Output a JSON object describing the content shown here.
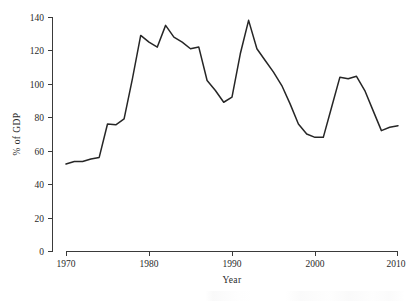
{
  "chart_data": {
    "type": "line",
    "title": "",
    "subtitle": "",
    "xlabel": "Year",
    "ylabel": "% of GDP",
    "xlim": [
      1970,
      2010
    ],
    "ylim": [
      0,
      140
    ],
    "xticks": [
      1970,
      1980,
      1990,
      2000,
      2010
    ],
    "yticks": [
      0,
      20,
      40,
      60,
      80,
      100,
      120,
      140
    ],
    "xtick_labels": [
      "1970",
      "1980",
      "1990",
      "2000",
      "2010"
    ],
    "ytick_labels": [
      "0",
      "20",
      "40",
      "60",
      "80",
      "100",
      "120",
      "140"
    ],
    "grid": false,
    "legend": null,
    "legend_position": "none",
    "line_color": "#262626",
    "series": [
      {
        "name": "% of GDP",
        "x": [
          1970,
          1971,
          1972,
          1973,
          1974,
          1975,
          1976,
          1977,
          1978,
          1979,
          1980,
          1981,
          1982,
          1983,
          1984,
          1985,
          1986,
          1987,
          1988,
          1989,
          1990,
          1991,
          1992,
          1993,
          1994,
          1995,
          1996,
          1997,
          1998,
          1999,
          2000,
          2001,
          2002,
          2003,
          2004,
          2005,
          2006,
          2007,
          2008,
          2009,
          2010
        ],
        "values": [
          52,
          53.5,
          53.5,
          55,
          56,
          76,
          75.5,
          79,
          103,
          129,
          125,
          122,
          135,
          128,
          125,
          121,
          122,
          102,
          96,
          89,
          92,
          118,
          138,
          121,
          114,
          107,
          99,
          88,
          76,
          70,
          68,
          68,
          86,
          104,
          103,
          104.5,
          96,
          84,
          72,
          74,
          75
        ]
      }
    ],
    "annotations": []
  },
  "axis": {
    "y_title": "% of GDP",
    "x_title": "Year"
  }
}
